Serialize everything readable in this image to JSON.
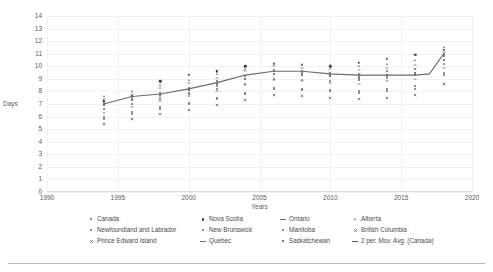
{
  "chart_data": {
    "type": "scatter",
    "title": "",
    "xlabel": "Years",
    "ylabel": "Days",
    "xlim": [
      1990,
      2020
    ],
    "ylim": [
      0,
      14
    ],
    "xticks": [
      1990,
      1995,
      2000,
      2005,
      2010,
      2015,
      2020
    ],
    "yticks": [
      0,
      1,
      2,
      3,
      4,
      5,
      6,
      7,
      8,
      9,
      10,
      11,
      12,
      13,
      14
    ],
    "grid": true,
    "legend_position": "bottom",
    "series": [
      {
        "name": "Canada",
        "marker": "dot",
        "x": [
          1994,
          1996,
          1998,
          2000,
          2002,
          2004,
          2006,
          2008,
          2010,
          2012,
          2014,
          2016,
          2018
        ],
        "y": [
          7.0,
          7.3,
          7.6,
          7.9,
          8.4,
          9.0,
          9.6,
          9.5,
          9.3,
          9.2,
          9.2,
          9.4,
          11.0
        ]
      },
      {
        "name": "Newfoundland and Labrador",
        "marker": "dot",
        "x": [
          1994,
          1996,
          1998,
          2000,
          2002,
          2004,
          2006,
          2008,
          2010,
          2012,
          2014,
          2016,
          2018
        ],
        "y": [
          6.0,
          6.4,
          6.8,
          7.0,
          7.4,
          7.8,
          8.2,
          8.1,
          8.0,
          7.9,
          8.0,
          8.2,
          9.5
        ]
      },
      {
        "name": "Prince Edward Island",
        "marker": "x",
        "x": [
          1994,
          1996,
          1998,
          2000,
          2002,
          2004,
          2006,
          2008,
          2010,
          2012,
          2014,
          2016,
          2018
        ],
        "y": [
          5.4,
          5.8,
          6.2,
          6.5,
          6.9,
          7.3,
          7.7,
          7.6,
          7.5,
          7.4,
          7.5,
          7.7,
          8.6
        ]
      },
      {
        "name": "Nova Scotia",
        "marker": "dot-filled",
        "x": [
          1994,
          1996,
          1998,
          2000,
          2002,
          2004,
          2006,
          2008,
          2010,
          2012,
          2014,
          2016,
          2018
        ],
        "y": [
          7.2,
          7.6,
          8.8,
          9.3,
          9.6,
          10.0,
          10.2,
          10.1,
          10.0,
          10.3,
          10.6,
          10.9,
          11.3
        ]
      },
      {
        "name": "New Brunswick",
        "marker": "dot",
        "x": [
          1994,
          1996,
          1998,
          2000,
          2002,
          2004,
          2006,
          2008,
          2010,
          2012,
          2014,
          2016,
          2018
        ],
        "y": [
          6.6,
          7.0,
          7.4,
          7.8,
          8.2,
          8.6,
          9.0,
          8.9,
          8.8,
          8.9,
          9.1,
          9.3,
          10.2
        ]
      },
      {
        "name": "Quebec",
        "marker": "dash",
        "x": [
          1994,
          1996,
          1998,
          2000,
          2002,
          2004,
          2006,
          2008,
          2010,
          2012,
          2014,
          2016,
          2018
        ],
        "y": [
          6.3,
          6.8,
          7.2,
          7.6,
          8.0,
          8.5,
          8.9,
          8.8,
          8.7,
          8.6,
          8.8,
          9.0,
          9.9
        ]
      },
      {
        "name": "Ontario",
        "marker": "dash",
        "x": [
          1994,
          1996,
          1998,
          2000,
          2002,
          2004,
          2006,
          2008,
          2010,
          2012,
          2014,
          2016,
          2018
        ],
        "y": [
          7.4,
          7.8,
          8.3,
          8.7,
          9.1,
          9.6,
          10.0,
          9.9,
          9.8,
          9.7,
          9.9,
          10.1,
          11.1
        ]
      },
      {
        "name": "Manitoba",
        "marker": "dot",
        "x": [
          1994,
          1996,
          1998,
          2000,
          2002,
          2004,
          2006,
          2008,
          2010,
          2012,
          2014,
          2016,
          2018
        ],
        "y": [
          5.8,
          6.2,
          6.6,
          7.1,
          7.5,
          7.9,
          8.3,
          8.2,
          8.1,
          8.0,
          8.2,
          8.4,
          9.3
        ]
      },
      {
        "name": "Saskatchewan",
        "marker": "square",
        "x": [
          1994,
          1996,
          1998,
          2000,
          2002,
          2004,
          2006,
          2008,
          2010,
          2012,
          2014,
          2016,
          2018
        ],
        "y": [
          6.9,
          7.3,
          7.7,
          8.1,
          8.6,
          9.0,
          9.4,
          9.3,
          9.2,
          9.1,
          9.3,
          9.5,
          10.5
        ]
      },
      {
        "name": "Alberta",
        "marker": "triangle",
        "x": [
          1994,
          1996,
          1998,
          2000,
          2002,
          2004,
          2006,
          2008,
          2010,
          2012,
          2014,
          2016,
          2018
        ],
        "y": [
          7.6,
          8.0,
          8.5,
          8.9,
          9.4,
          9.8,
          10.3,
          10.2,
          10.1,
          10.0,
          10.2,
          10.5,
          11.5
        ]
      },
      {
        "name": "British Columbia",
        "marker": "x",
        "x": [
          1994,
          1996,
          1998,
          2000,
          2002,
          2004,
          2006,
          2008,
          2010,
          2012,
          2014,
          2016,
          2018
        ],
        "y": [
          7.1,
          7.5,
          7.9,
          8.3,
          8.8,
          9.2,
          9.7,
          9.6,
          9.5,
          9.4,
          9.6,
          9.8,
          10.8
        ]
      }
    ],
    "trend": {
      "name": "2 per. Mov. Avg. (Canada)",
      "x": [
        1994,
        1996,
        1998,
        2000,
        2002,
        2004,
        2006,
        2008,
        2010,
        2012,
        2014,
        2016,
        2017,
        2018
      ],
      "y": [
        7.0,
        7.6,
        7.8,
        8.2,
        8.7,
        9.3,
        9.6,
        9.6,
        9.4,
        9.3,
        9.3,
        9.3,
        9.4,
        11.0
      ]
    }
  },
  "axes": {
    "ylabel": "Days",
    "xlabel": "Years",
    "yticks": [
      "14",
      "13",
      "12",
      "11",
      "10",
      "9",
      "8",
      "7",
      "6",
      "5",
      "4",
      "3",
      "2",
      "1",
      "0"
    ],
    "xticks": [
      "1990",
      "1995",
      "2000",
      "2005",
      "2010",
      "2015",
      "2020"
    ]
  },
  "legend": {
    "items": [
      {
        "label": "Canada",
        "marker": "dot"
      },
      {
        "label": "Nova Scotia",
        "marker": "dot-filled"
      },
      {
        "label": "Ontario",
        "marker": "dash"
      },
      {
        "label": "Alberta",
        "marker": "triangle"
      },
      {
        "label": "Newfoundland and Labrador",
        "marker": "dot"
      },
      {
        "label": "New Brunswick",
        "marker": "dot"
      },
      {
        "label": "Manitoba",
        "marker": "dot"
      },
      {
        "label": "British Columbia",
        "marker": "x"
      },
      {
        "label": "Prince Edward Island",
        "marker": "x"
      },
      {
        "label": "Quebec",
        "marker": "dash"
      },
      {
        "label": "Saskatchewan",
        "marker": "square"
      },
      {
        "label": "2 per. Mov. Avg. (Canada)",
        "marker": "line"
      }
    ]
  },
  "colors": {
    "trendline": "#6b6b6e",
    "gridline": "#f2f2f2",
    "axis": "#d9d9d9",
    "text": "#59595b",
    "rule": "#b9b9bc"
  }
}
